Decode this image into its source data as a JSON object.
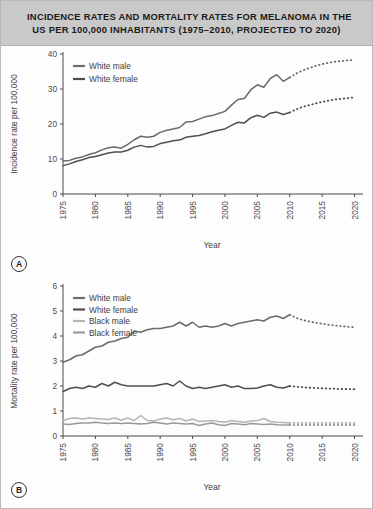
{
  "figure": {
    "title_line1": "INCIDENCE RATES AND MORTALITY RATES FOR MELANOMA IN THE",
    "title_line2": "US PER 100,000 INHABITANTS (1975–2010, PROJECTED TO 2020)",
    "panel_a_letter": "A",
    "panel_b_letter": "B",
    "colors": {
      "white_male": "#6b6b6b",
      "white_female": "#4f4f4f",
      "black_male": "#b4b4b4",
      "black_female": "#9a9a9a",
      "axis": "#4a4a4a",
      "title_band": "#c9c9c9",
      "frame": "#b9b9b9"
    }
  },
  "chart_data": [
    {
      "id": "panel-a",
      "type": "line",
      "title": "Incidence rates for melanoma, US per 100,000",
      "xlabel": "Year",
      "ylabel": "Incidence rate per 100,000",
      "xlim": [
        1975,
        2021
      ],
      "ylim": [
        0,
        40
      ],
      "yticks": [
        0,
        10,
        20,
        30,
        40
      ],
      "xticks": [
        1975,
        1980,
        1985,
        1990,
        1995,
        2000,
        2005,
        2010,
        2015,
        2020
      ],
      "grid": false,
      "legend_position": "top-left",
      "x": [
        1975,
        1976,
        1977,
        1978,
        1979,
        1980,
        1981,
        1982,
        1983,
        1984,
        1985,
        1986,
        1987,
        1988,
        1989,
        1990,
        1991,
        1992,
        1993,
        1994,
        1995,
        1996,
        1997,
        1998,
        1999,
        2000,
        2001,
        2002,
        2003,
        2004,
        2005,
        2006,
        2007,
        2008,
        2009,
        2010
      ],
      "x_projected": [
        2010,
        2011,
        2012,
        2013,
        2014,
        2015,
        2016,
        2017,
        2018,
        2019,
        2020
      ],
      "series": [
        {
          "name": "White male",
          "color": "#6b6b6b",
          "values": [
            9.4,
            9.6,
            10.2,
            10.6,
            11.3,
            11.8,
            12.6,
            13.2,
            13.4,
            13.1,
            14.2,
            15.5,
            16.5,
            16.2,
            16.5,
            17.6,
            18.2,
            18.6,
            19.0,
            20.6,
            20.7,
            21.4,
            22.1,
            22.4,
            23.0,
            23.6,
            25.4,
            27.0,
            27.3,
            29.8,
            31.2,
            30.5,
            33.0,
            34.1,
            32.2,
            33.3
          ],
          "projected": [
            33.3,
            34.4,
            35.3,
            36.0,
            36.6,
            37.1,
            37.5,
            37.8,
            38.0,
            38.2,
            38.3
          ]
        },
        {
          "name": "White female",
          "color": "#4f4f4f",
          "values": [
            8.1,
            8.6,
            9.3,
            9.8,
            10.4,
            10.7,
            11.2,
            11.7,
            12.0,
            12.0,
            12.5,
            13.4,
            13.9,
            13.4,
            13.6,
            14.4,
            14.8,
            15.2,
            15.4,
            16.2,
            16.5,
            16.7,
            17.2,
            17.8,
            18.2,
            18.6,
            19.6,
            20.5,
            20.3,
            21.8,
            22.5,
            21.9,
            23.1,
            23.4,
            22.7,
            23.3
          ],
          "projected": [
            23.3,
            24.2,
            24.9,
            25.4,
            25.9,
            26.3,
            26.7,
            27.0,
            27.2,
            27.4,
            27.6
          ]
        }
      ]
    },
    {
      "id": "panel-b",
      "type": "line",
      "title": "Mortality rates for melanoma, US per 100,000",
      "xlabel": "Year",
      "ylabel": "Mortality rate per 100,000",
      "xlim": [
        1975,
        2021
      ],
      "ylim": [
        0,
        6
      ],
      "yticks": [
        0,
        1,
        2,
        3,
        4,
        5,
        6
      ],
      "xticks": [
        1975,
        1980,
        1985,
        1990,
        1995,
        2000,
        2005,
        2010,
        2015,
        2020
      ],
      "grid": false,
      "legend_position": "top-left",
      "x": [
        1975,
        1976,
        1977,
        1978,
        1979,
        1980,
        1981,
        1982,
        1983,
        1984,
        1985,
        1986,
        1987,
        1988,
        1989,
        1990,
        1991,
        1992,
        1993,
        1994,
        1995,
        1996,
        1997,
        1998,
        1999,
        2000,
        2001,
        2002,
        2003,
        2004,
        2005,
        2006,
        2007,
        2008,
        2009,
        2010
      ],
      "x_projected": [
        2010,
        2011,
        2012,
        2013,
        2014,
        2015,
        2016,
        2017,
        2018,
        2019,
        2020
      ],
      "series": [
        {
          "name": "White male",
          "color": "#6b6b6b",
          "values": [
            2.95,
            3.05,
            3.2,
            3.25,
            3.4,
            3.55,
            3.6,
            3.75,
            3.8,
            3.9,
            3.95,
            4.2,
            4.15,
            4.25,
            4.3,
            4.3,
            4.35,
            4.4,
            4.55,
            4.4,
            4.55,
            4.35,
            4.4,
            4.35,
            4.4,
            4.5,
            4.4,
            4.5,
            4.55,
            4.6,
            4.65,
            4.6,
            4.75,
            4.8,
            4.7,
            4.85
          ],
          "projected": [
            4.85,
            4.72,
            4.64,
            4.58,
            4.53,
            4.49,
            4.45,
            4.42,
            4.39,
            4.37,
            4.35
          ]
        },
        {
          "name": "White female",
          "color": "#4f4f4f",
          "values": [
            1.78,
            1.9,
            1.95,
            1.9,
            2.0,
            1.95,
            2.1,
            2.0,
            2.15,
            2.05,
            2.0,
            2.0,
            2.0,
            2.0,
            2.0,
            2.05,
            2.1,
            2.0,
            2.2,
            2.0,
            1.9,
            1.95,
            1.9,
            1.95,
            2.0,
            2.05,
            1.95,
            2.0,
            1.9,
            1.9,
            1.92,
            2.0,
            2.05,
            1.95,
            1.92,
            2.0
          ],
          "projected": [
            2.0,
            1.97,
            1.95,
            1.93,
            1.92,
            1.91,
            1.9,
            1.89,
            1.88,
            1.88,
            1.87
          ]
        },
        {
          "name": "Black male",
          "color": "#b4b4b4",
          "values": [
            0.62,
            0.7,
            0.72,
            0.68,
            0.72,
            0.7,
            0.68,
            0.66,
            0.72,
            0.63,
            0.72,
            0.62,
            0.82,
            0.62,
            0.6,
            0.68,
            0.72,
            0.65,
            0.7,
            0.6,
            0.68,
            0.58,
            0.6,
            0.62,
            0.58,
            0.55,
            0.62,
            0.58,
            0.55,
            0.6,
            0.62,
            0.7,
            0.58,
            0.55,
            0.54,
            0.52
          ],
          "projected": [
            0.52,
            0.52,
            0.52,
            0.52,
            0.52,
            0.52,
            0.52,
            0.52,
            0.52,
            0.52,
            0.52
          ]
        },
        {
          "name": "Black female",
          "color": "#9a9a9a",
          "values": [
            0.48,
            0.46,
            0.5,
            0.52,
            0.52,
            0.55,
            0.52,
            0.5,
            0.52,
            0.5,
            0.52,
            0.5,
            0.48,
            0.5,
            0.55,
            0.52,
            0.48,
            0.52,
            0.5,
            0.48,
            0.5,
            0.42,
            0.48,
            0.52,
            0.45,
            0.42,
            0.5,
            0.48,
            0.45,
            0.5,
            0.48,
            0.46,
            0.48,
            0.45,
            0.44,
            0.44
          ],
          "projected": [
            0.44,
            0.44,
            0.44,
            0.44,
            0.44,
            0.44,
            0.44,
            0.44,
            0.44,
            0.44,
            0.44
          ]
        }
      ]
    }
  ]
}
